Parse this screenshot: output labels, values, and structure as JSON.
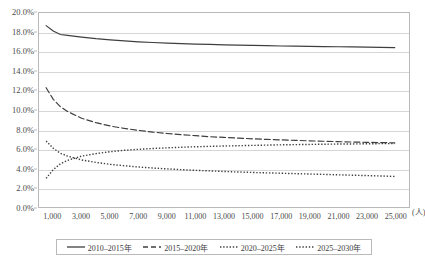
{
  "chart": {
    "title": "",
    "x_unit_label": "(人)"
  },
  "legend": {
    "items": [
      {
        "label": "2010–2015年",
        "style": "solid",
        "color": "#3f3f3f",
        "icon": "solid-line-icon"
      },
      {
        "label": "2015–2020年",
        "style": "dashed",
        "color": "#3f3f3f",
        "icon": "dashed-line-icon"
      },
      {
        "label": "2020–2025年",
        "style": "dotted",
        "color": "#3f3f3f",
        "icon": "dotted-line-icon"
      },
      {
        "label": "2025–2030年",
        "style": "dotted",
        "color": "#3f3f3f",
        "icon": "dotted-line-icon"
      }
    ]
  },
  "chart_data": {
    "type": "line",
    "title": "",
    "xlabel": "(人)",
    "ylabel": "",
    "xlim": [
      0,
      26000
    ],
    "ylim": [
      0,
      0.2
    ],
    "grid": true,
    "legend_position": "bottom",
    "y_ticks": [
      "0.0%",
      "2.0%",
      "4.0%",
      "6.0%",
      "8.0%",
      "10.0%",
      "12.0%",
      "14.0%",
      "16.0%",
      "18.0%",
      "20.0%"
    ],
    "y_tick_values": [
      0,
      2,
      4,
      6,
      8,
      10,
      12,
      14,
      16,
      18,
      20
    ],
    "x_ticks": [
      "1,000",
      "3,000",
      "5,000",
      "7,000",
      "9,000",
      "11,000",
      "13,000",
      "15,000",
      "17,000",
      "19,000",
      "21,000",
      "23,000",
      "25,000"
    ],
    "x_tick_values": [
      1000,
      3000,
      5000,
      7000,
      9000,
      11000,
      13000,
      15000,
      17000,
      19000,
      21000,
      23000,
      25000
    ],
    "x": [
      500,
      1000,
      1500,
      2000,
      3000,
      4000,
      5000,
      6000,
      7000,
      8000,
      9000,
      10000,
      11000,
      12000,
      13000,
      14000,
      15000,
      16000,
      17000,
      18000,
      19000,
      20000,
      21000,
      22000,
      23000,
      24000,
      25000
    ],
    "series": [
      {
        "name": "2010–2015年",
        "style": "solid",
        "values": [
          18.7,
          18.15,
          17.78,
          17.7,
          17.52,
          17.35,
          17.22,
          17.12,
          17.03,
          16.96,
          16.9,
          16.85,
          16.8,
          16.76,
          16.72,
          16.69,
          16.66,
          16.63,
          16.6,
          16.58,
          16.56,
          16.54,
          16.52,
          16.5,
          16.48,
          16.46,
          16.44
        ]
      },
      {
        "name": "2015–2020年",
        "style": "dashed",
        "values": [
          12.3,
          11.1,
          10.35,
          9.85,
          9.15,
          8.7,
          8.35,
          8.1,
          7.9,
          7.72,
          7.58,
          7.46,
          7.35,
          7.25,
          7.17,
          7.1,
          7.03,
          6.97,
          6.92,
          6.87,
          6.82,
          6.78,
          6.74,
          6.7,
          6.67,
          6.64,
          6.61
        ]
      },
      {
        "name": "2020–2025年",
        "style": "dotted",
        "values": [
          6.8,
          6.05,
          5.55,
          5.25,
          4.85,
          4.6,
          4.4,
          4.25,
          4.12,
          4.02,
          3.93,
          3.85,
          3.78,
          3.72,
          3.66,
          3.61,
          3.56,
          3.52,
          3.48,
          3.44,
          3.4,
          3.36,
          3.32,
          3.28,
          3.24,
          3.2,
          3.15
        ]
      },
      {
        "name": "2025–2030年",
        "style": "dotted",
        "values": [
          2.95,
          3.85,
          4.45,
          4.8,
          5.25,
          5.5,
          5.7,
          5.85,
          5.95,
          6.03,
          6.1,
          6.16,
          6.21,
          6.25,
          6.29,
          6.32,
          6.35,
          6.38,
          6.41,
          6.43,
          6.45,
          6.47,
          6.49,
          6.5,
          6.52,
          6.53,
          6.54
        ]
      }
    ]
  }
}
